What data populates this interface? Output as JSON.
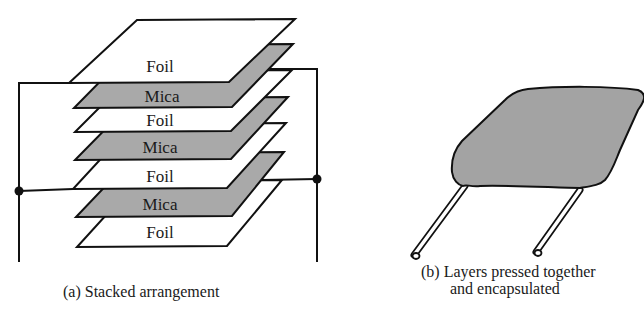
{
  "figure": {
    "panel_a": {
      "caption": "(a) Stacked arrangement",
      "layers": [
        {
          "label": "Foil",
          "material": "foil"
        },
        {
          "label": "Mica",
          "material": "mica"
        },
        {
          "label": "Foil",
          "material": "foil"
        },
        {
          "label": "Mica",
          "material": "mica"
        },
        {
          "label": "Foil",
          "material": "foil"
        },
        {
          "label": "Mica",
          "material": "mica"
        },
        {
          "label": "Foil",
          "material": "foil"
        }
      ]
    },
    "panel_b": {
      "caption_line1": "(b) Layers pressed together",
      "caption_line2": "and encapsulated"
    },
    "colors": {
      "foil_fill": "#ffffff",
      "mica_fill": "#a9a9a9",
      "encapsulation_fill": "#a3a3a3",
      "stroke": "#111111"
    }
  }
}
